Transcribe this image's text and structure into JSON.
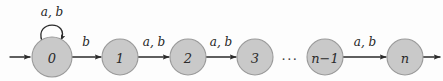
{
  "figure": {
    "type": "finite-state-automaton",
    "alphabet": [
      "a",
      "b"
    ],
    "colors": {
      "state_fill": "#c9c9c9",
      "state_stroke": "#9a9a9a",
      "edge": "#2b2b2b",
      "text": "#1f1f1f",
      "background": "#fdfdfd"
    }
  },
  "states": [
    {
      "id": "q0",
      "label": "0",
      "cx": 52,
      "cy": 57,
      "r": 20
    },
    {
      "id": "q1",
      "label": "1",
      "cx": 120,
      "cy": 57,
      "r": 18
    },
    {
      "id": "q2",
      "label": "2",
      "cx": 188,
      "cy": 57,
      "r": 18
    },
    {
      "id": "q3",
      "label": "3",
      "cx": 255,
      "cy": 57,
      "r": 18
    },
    {
      "id": "qn1",
      "label": "n−1",
      "cx": 325,
      "cy": 57,
      "r": 18
    },
    {
      "id": "qn",
      "label": "n",
      "cx": 405,
      "cy": 57,
      "r": 18
    }
  ],
  "ellipsis": {
    "text": "···",
    "x": 290,
    "y": 58
  },
  "start_arrow": {
    "label": "",
    "x1": 10,
    "y1": 57,
    "x2": 31,
    "y2": 57
  },
  "end_arrow": {
    "label": "",
    "x1": 424,
    "y1": 57,
    "x2": 441,
    "y2": 57
  },
  "self_loop": {
    "on_state": "q0",
    "label": "a, b",
    "label_x": 52,
    "label_y": 16
  },
  "transitions": [
    {
      "from": "q0",
      "to": "q1",
      "label": "b",
      "label_x": 86,
      "label_y": 44
    },
    {
      "from": "q1",
      "to": "q2",
      "label": "a, b",
      "label_x": 154,
      "label_y": 44
    },
    {
      "from": "q2",
      "to": "q3",
      "label": "a, b",
      "label_x": 221,
      "label_y": 44
    },
    {
      "from": "qn1",
      "to": "qn",
      "label": "a, b",
      "label_x": 365,
      "label_y": 44
    }
  ]
}
